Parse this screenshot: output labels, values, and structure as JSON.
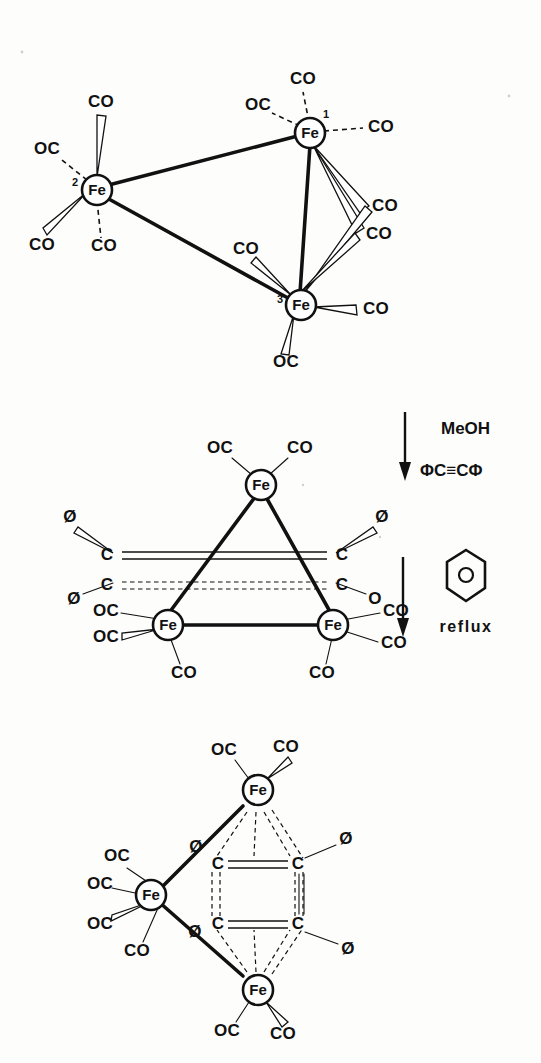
{
  "figure": {
    "kind": "chemical-reaction-scheme",
    "metal_label": "Fe",
    "ligand_co": "CO",
    "ligand_oc": "OC",
    "carbon_label": "C",
    "phenyl_label": "Ø",
    "oxygen_label": "O"
  },
  "structure_top": {
    "name": "Fe3(CO)12 cluster",
    "metals": [
      {
        "id": "fe1",
        "label": "Fe",
        "index": "1"
      },
      {
        "id": "fe2",
        "label": "Fe",
        "index": "2"
      },
      {
        "id": "fe3",
        "label": "Fe",
        "index": "3"
      }
    ],
    "fe1_ligands": [
      {
        "text": "CO",
        "position": "top",
        "style": "dashed"
      },
      {
        "text": "OC",
        "position": "upper-left",
        "style": "dashed"
      },
      {
        "text": "CO",
        "position": "right",
        "style": "dashed"
      }
    ],
    "fe2_ligands": [
      {
        "text": "CO",
        "position": "top",
        "style": "wedge"
      },
      {
        "text": "OC",
        "position": "upper-left",
        "style": "dashed"
      },
      {
        "text": "CO",
        "position": "lower-left",
        "style": "wedge"
      },
      {
        "text": "CO",
        "position": "bottom",
        "style": "dashed"
      }
    ],
    "fe3_ligands": [
      {
        "text": "CO",
        "position": "upper-left",
        "style": "wedge"
      },
      {
        "text": "CO",
        "position": "right",
        "style": "wedge"
      },
      {
        "text": "OC",
        "position": "bottom",
        "style": "wedge"
      }
    ],
    "bridging_ligands": [
      {
        "text": "CO",
        "position": "right-upper",
        "bridges": "fe1-fe3"
      },
      {
        "text": "CO",
        "position": "right-lower",
        "bridges": "fe1-fe3"
      }
    ]
  },
  "arrow_one": {
    "name": "reaction-arrow-1",
    "reagent_line_1": "MeOH",
    "reagent_line_2": "ΦC≡CΦ"
  },
  "structure_middle": {
    "name": "Fe3(CO)9(PhC2Ph)(C2O) triangular cluster",
    "metals": [
      {
        "id": "fe-top",
        "label": "Fe"
      },
      {
        "id": "fe-left",
        "label": "Fe"
      },
      {
        "id": "fe-right",
        "label": "Fe"
      }
    ],
    "fe_top_ligands": [
      {
        "text": "OC",
        "position": "upper-left"
      },
      {
        "text": "CO",
        "position": "upper-right"
      }
    ],
    "fe_left_ligands": [
      {
        "text": "OC",
        "position": "left-upper"
      },
      {
        "text": "OC",
        "position": "left-lower"
      },
      {
        "text": "CO",
        "position": "bottom"
      }
    ],
    "fe_right_ligands": [
      {
        "text": "CO",
        "position": "right-upper"
      },
      {
        "text": "CO",
        "position": "right-lower"
      },
      {
        "text": "CO",
        "position": "bottom"
      }
    ],
    "bridge_carbons": [
      {
        "label": "C",
        "position": "upper-left",
        "substituent": "Ø"
      },
      {
        "label": "C",
        "position": "upper-right",
        "substituent": "Ø"
      },
      {
        "label": "C",
        "position": "lower-left",
        "substituent": "Ø"
      },
      {
        "label": "C",
        "position": "lower-right",
        "substituent": "O"
      }
    ],
    "bond_upper_style": "double-solid",
    "bond_lower_style": "double-dashed"
  },
  "arrow_two": {
    "name": "reaction-arrow-2",
    "solvent_icon": "benzene-ring",
    "condition": "reflux"
  },
  "structure_bottom": {
    "name": "Fe3(CO)8(PhC2Ph)2 cluster",
    "metals": [
      {
        "id": "fe-top",
        "label": "Fe"
      },
      {
        "id": "fe-left",
        "label": "Fe"
      },
      {
        "id": "fe-bottom",
        "label": "Fe"
      }
    ],
    "fe_top_ligands": [
      {
        "text": "OC",
        "position": "upper-left"
      },
      {
        "text": "CO",
        "position": "upper-right"
      }
    ],
    "fe_left_ligands": [
      {
        "text": "OC",
        "position": "top"
      },
      {
        "text": "OC",
        "position": "left-upper"
      },
      {
        "text": "OC",
        "position": "left-lower"
      },
      {
        "text": "CO",
        "position": "bottom-left"
      }
    ],
    "fe_bottom_ligands": [
      {
        "text": "OC",
        "position": "bottom-left"
      },
      {
        "text": "CO",
        "position": "bottom-right"
      }
    ],
    "bridge_carbons": [
      {
        "label": "C",
        "position": "upper-left"
      },
      {
        "label": "C",
        "position": "upper-right",
        "substituent": "Ø"
      },
      {
        "label": "C",
        "position": "lower-left"
      },
      {
        "label": "C",
        "position": "lower-right",
        "substituent": "Ø"
      }
    ],
    "edge_phenyls": [
      {
        "text": "Ø",
        "position": "upper-edge"
      },
      {
        "text": "Ø",
        "position": "lower-edge"
      }
    ],
    "bond_upper_style": "double-solid",
    "bond_lower_style": "double-solid"
  }
}
